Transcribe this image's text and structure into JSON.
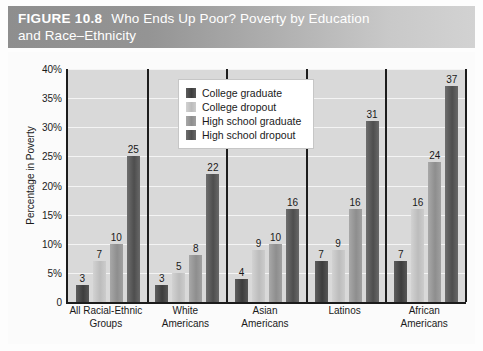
{
  "figure": {
    "number": "FIGURE 10.8",
    "title": "Who Ends Up Poor? Poverty by Education and Race–Ethnicity",
    "title_line1": "Who Ends Up Poor? Poverty by Education",
    "title_line2": "and Race–Ethnicity"
  },
  "chart_data": {
    "type": "bar",
    "title": "Who Ends Up Poor? Poverty by Education and Race–Ethnicity",
    "xlabel": "",
    "ylabel": "Percentage in Poverty",
    "ylim": [
      0,
      40
    ],
    "ytick_labels": [
      "0",
      "5%",
      "10%",
      "15%",
      "20%",
      "25%",
      "30%",
      "35%",
      "40%"
    ],
    "ytick_values": [
      0,
      5,
      10,
      15,
      20,
      25,
      30,
      35,
      40
    ],
    "grid": true,
    "legend_position": "upper-center",
    "categories": [
      "All Racial-Ethnic Groups",
      "White Americans",
      "Asian Americans",
      "Latinos",
      "African Americans"
    ],
    "category_lines": [
      [
        "All Racial-Ethnic",
        "Groups"
      ],
      [
        "White",
        "Americans"
      ],
      [
        "Asian",
        "Americans"
      ],
      [
        "Latinos",
        ""
      ],
      [
        "African",
        "Americans"
      ]
    ],
    "series": [
      {
        "name": "College graduate",
        "color": "#4a4a4a",
        "values": [
          3,
          3,
          4,
          7,
          7
        ]
      },
      {
        "name": "College dropout",
        "color": "#c6c6c6",
        "values": [
          7,
          5,
          9,
          9,
          16
        ]
      },
      {
        "name": "High school graduate",
        "color": "#979797",
        "values": [
          10,
          8,
          10,
          16,
          24
        ]
      },
      {
        "name": "High school dropout",
        "color": "#5a5a5a",
        "values": [
          25,
          22,
          16,
          31,
          37
        ]
      }
    ]
  }
}
